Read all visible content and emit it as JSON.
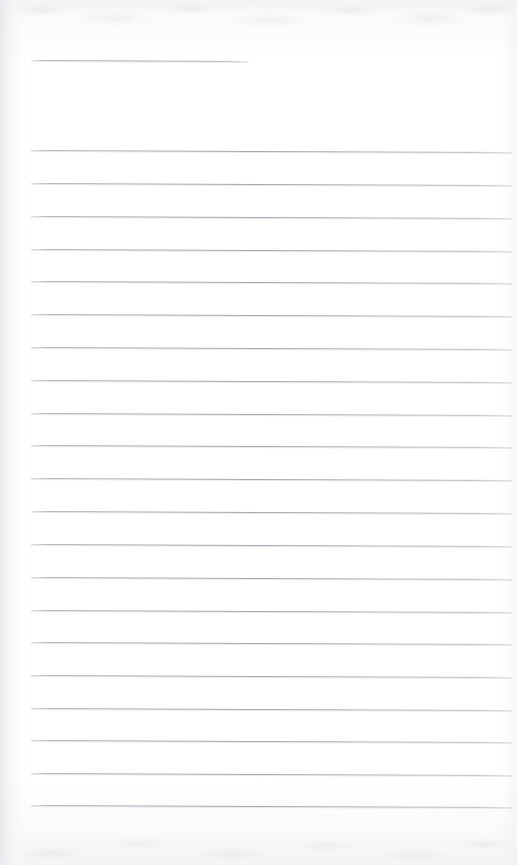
{
  "document": {
    "kind": "scanned-lined-paper",
    "title": "Blank ruled notebook page",
    "page_width": 517,
    "page_height": 865,
    "written_content": "",
    "text_blocks": [],
    "background_color": "#fdfdfd",
    "rule_color": "#a6abb5",
    "rule_thickness_px": 1,
    "left_margin_x": 31,
    "right_margin_x": 512,
    "line_spacing_px": 32.75,
    "skew_degrees": 0.25,
    "scan_artifacts": {
      "top_band_height": 34,
      "bottom_band_height": 40,
      "left_shadow_width": 30
    }
  },
  "rules": [
    {
      "name": "rule-header-short",
      "y": 60,
      "x1": 31,
      "x2": 248,
      "full_width": false
    },
    {
      "name": "rule-1",
      "y": 150,
      "x1": 31,
      "x2": 512,
      "full_width": true
    },
    {
      "name": "rule-2",
      "y": 183,
      "x1": 31,
      "x2": 512,
      "full_width": true
    },
    {
      "name": "rule-3",
      "y": 216,
      "x1": 31,
      "x2": 512,
      "full_width": true
    },
    {
      "name": "rule-4",
      "y": 249,
      "x1": 31,
      "x2": 512,
      "full_width": true
    },
    {
      "name": "rule-5",
      "y": 281,
      "x1": 31,
      "x2": 512,
      "full_width": true
    },
    {
      "name": "rule-6",
      "y": 314,
      "x1": 31,
      "x2": 512,
      "full_width": true
    },
    {
      "name": "rule-7",
      "y": 347,
      "x1": 31,
      "x2": 512,
      "full_width": true
    },
    {
      "name": "rule-8",
      "y": 380,
      "x1": 31,
      "x2": 512,
      "full_width": true
    },
    {
      "name": "rule-9",
      "y": 413,
      "x1": 31,
      "x2": 512,
      "full_width": true
    },
    {
      "name": "rule-10",
      "y": 445,
      "x1": 31,
      "x2": 512,
      "full_width": true
    },
    {
      "name": "rule-11",
      "y": 478,
      "x1": 31,
      "x2": 512,
      "full_width": true
    },
    {
      "name": "rule-12",
      "y": 511,
      "x1": 31,
      "x2": 512,
      "full_width": true
    },
    {
      "name": "rule-13",
      "y": 544,
      "x1": 31,
      "x2": 512,
      "full_width": true
    },
    {
      "name": "rule-14",
      "y": 577,
      "x1": 31,
      "x2": 512,
      "full_width": true
    },
    {
      "name": "rule-15",
      "y": 610,
      "x1": 31,
      "x2": 512,
      "full_width": true
    },
    {
      "name": "rule-16",
      "y": 642,
      "x1": 31,
      "x2": 512,
      "full_width": true
    },
    {
      "name": "rule-17",
      "y": 675,
      "x1": 31,
      "x2": 512,
      "full_width": true
    },
    {
      "name": "rule-18",
      "y": 708,
      "x1": 31,
      "x2": 512,
      "full_width": true
    },
    {
      "name": "rule-19",
      "y": 740,
      "x1": 31,
      "x2": 512,
      "full_width": true
    },
    {
      "name": "rule-20",
      "y": 773,
      "x1": 31,
      "x2": 512,
      "full_width": true
    },
    {
      "name": "rule-21",
      "y": 805,
      "x1": 31,
      "x2": 512,
      "full_width": true
    }
  ]
}
